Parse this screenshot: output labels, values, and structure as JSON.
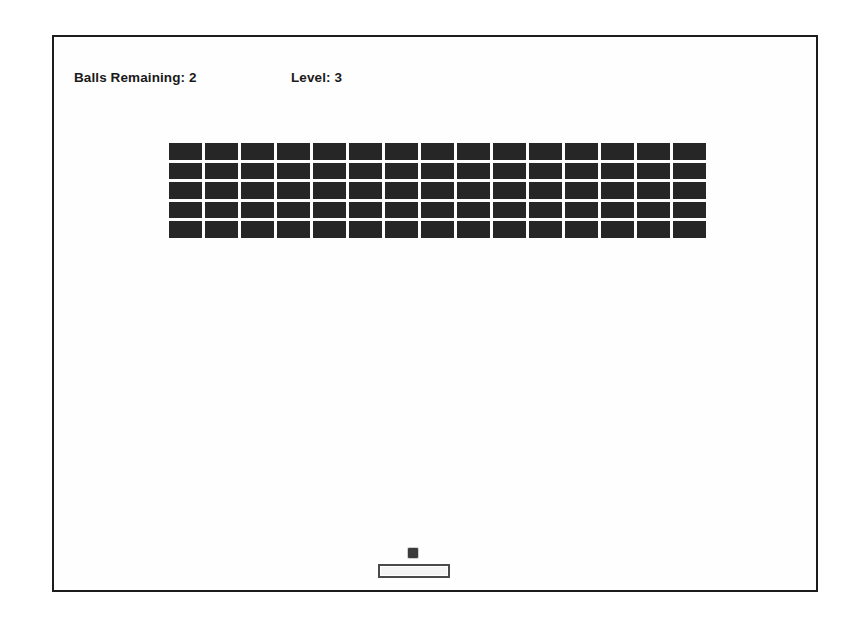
{
  "app": {
    "title": "Breakout",
    "background_color": "#ffffff",
    "playfield_color": "#fefefe",
    "border_color": "#1c1c1c"
  },
  "hud": {
    "balls_label": "Balls Remaining: 2",
    "balls_remaining": 2,
    "level_label": "Level: 3",
    "level": 3,
    "text_color": "#1a1a1a"
  },
  "bricks": {
    "columns": 15,
    "rows": 5,
    "total": 75,
    "remaining": 75,
    "color": "#262626",
    "gap_color": "#ffffff",
    "grid": [
      [
        1,
        1,
        1,
        1,
        1,
        1,
        1,
        1,
        1,
        1,
        1,
        1,
        1,
        1,
        1
      ],
      [
        1,
        1,
        1,
        1,
        1,
        1,
        1,
        1,
        1,
        1,
        1,
        1,
        1,
        1,
        1
      ],
      [
        1,
        1,
        1,
        1,
        1,
        1,
        1,
        1,
        1,
        1,
        1,
        1,
        1,
        1,
        1
      ],
      [
        1,
        1,
        1,
        1,
        1,
        1,
        1,
        1,
        1,
        1,
        1,
        1,
        1,
        1,
        1
      ],
      [
        1,
        1,
        1,
        1,
        1,
        1,
        1,
        1,
        1,
        1,
        1,
        1,
        1,
        1,
        1
      ]
    ]
  },
  "ball": {
    "color": "#3b3b3b",
    "size": 10,
    "x": 408,
    "y": 546
  },
  "paddle": {
    "fill_color": "#f4f4f4",
    "border_color": "#4a4a4a",
    "width": 72,
    "height": 14,
    "x": 378,
    "y": 562
  }
}
